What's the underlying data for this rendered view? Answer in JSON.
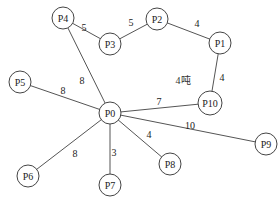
{
  "diagram": {
    "caption": "4吨",
    "nodes": [
      {
        "id": "P0",
        "label": "P0",
        "x": 110,
        "y": 113
      },
      {
        "id": "P1",
        "label": "P1",
        "x": 220,
        "y": 43
      },
      {
        "id": "P2",
        "label": "P2",
        "x": 157,
        "y": 19
      },
      {
        "id": "P3",
        "label": "P3",
        "x": 110,
        "y": 44
      },
      {
        "id": "P4",
        "label": "P4",
        "x": 63,
        "y": 18
      },
      {
        "id": "P5",
        "label": "P5",
        "x": 20,
        "y": 82
      },
      {
        "id": "P6",
        "label": "P6",
        "x": 28,
        "y": 176
      },
      {
        "id": "P7",
        "label": "P7",
        "x": 110,
        "y": 185
      },
      {
        "id": "P8",
        "label": "P8",
        "x": 170,
        "y": 164
      },
      {
        "id": "P9",
        "label": "P9",
        "x": 266,
        "y": 144
      },
      {
        "id": "P10",
        "label": "P10",
        "x": 210,
        "y": 103
      }
    ],
    "edges": [
      {
        "from": "P4",
        "to": "P3",
        "weight": "5",
        "lx": 84,
        "ly": 27
      },
      {
        "from": "P3",
        "to": "P2",
        "weight": "5",
        "lx": 131,
        "ly": 22
      },
      {
        "from": "P2",
        "to": "P1",
        "weight": "4",
        "lx": 197,
        "ly": 23
      },
      {
        "from": "P1",
        "to": "P10",
        "weight": "4",
        "lx": 222,
        "ly": 77
      },
      {
        "from": "P4",
        "to": "P0",
        "weight": "8",
        "lx": 82,
        "ly": 80
      },
      {
        "from": "P5",
        "to": "P0",
        "weight": "8",
        "lx": 63,
        "ly": 90
      },
      {
        "from": "P0",
        "to": "P10",
        "weight": "7",
        "lx": 159,
        "ly": 101
      },
      {
        "from": "P0",
        "to": "P9",
        "weight": "10",
        "lx": 190,
        "ly": 125
      },
      {
        "from": "P0",
        "to": "P8",
        "weight": "4",
        "lx": 149,
        "ly": 134
      },
      {
        "from": "P0",
        "to": "P7",
        "weight": "3",
        "lx": 114,
        "ly": 152
      },
      {
        "from": "P0",
        "to": "P6",
        "weight": "8",
        "lx": 75,
        "ly": 153
      }
    ],
    "caption_pos": {
      "x": 183,
      "y": 80
    }
  }
}
